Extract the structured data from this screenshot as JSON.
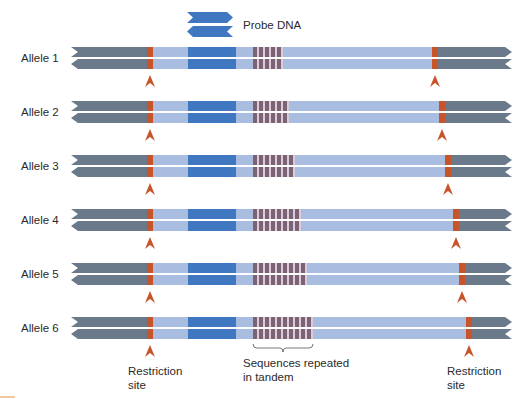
{
  "figure": {
    "probe_label": "Probe DNA",
    "colors": {
      "flank": "#6b7a8a",
      "light": "#a9bde0",
      "probe": "#3f78c0",
      "site": "#c8552a",
      "repeat_dark": "#7d6275",
      "repeat_light": "#d8cdd8",
      "arrow": "#c8552a"
    },
    "layout": {
      "left_x": 71,
      "right_x": 512,
      "left_site_x": 147,
      "site_width": 6,
      "probe_x": 188,
      "probe_width": 48,
      "repeat_start_x": 253,
      "repeat_unit_width": 6,
      "strand_height": 10,
      "strand_gap": 2
    },
    "alleles": [
      {
        "label": "Allele 1",
        "center_y": 58,
        "repeats": 5,
        "right_site_x": 432
      },
      {
        "label": "Allele 2",
        "center_y": 112,
        "repeats": 6,
        "right_site_x": 439
      },
      {
        "label": "Allele 3",
        "center_y": 166,
        "repeats": 7,
        "right_site_x": 445
      },
      {
        "label": "Allele 4",
        "center_y": 220,
        "repeats": 8,
        "right_site_x": 453
      },
      {
        "label": "Allele 5",
        "center_y": 274,
        "repeats": 9,
        "right_site_x": 459
      },
      {
        "label": "Allele 6",
        "center_y": 328,
        "repeats": 10,
        "right_site_x": 466
      }
    ],
    "annotations": {
      "left_site": {
        "line1": "Restriction",
        "line2": "site"
      },
      "repeats": {
        "line1": "Sequences repeated",
        "line2": "in tandem"
      },
      "right_site": {
        "line1": "Restriction",
        "line2": "site"
      }
    }
  }
}
